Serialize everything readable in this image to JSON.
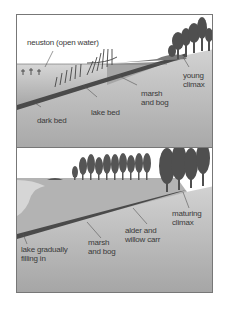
{
  "diagram": {
    "panels": [
      {
        "id": "stage-1",
        "labels": {
          "neuston": "neuston (open water)",
          "dark_bed": "dark bed",
          "lake_bed": "lake bed",
          "marsh_line1": "marsh",
          "marsh_line2": "and bog",
          "climax_line1": "young",
          "climax_line2": "climax"
        }
      },
      {
        "id": "stage-2",
        "labels": {
          "lake_line1": "lake gradually",
          "lake_line2": "filling in",
          "marsh_line1": "marsh",
          "marsh_line2": "and bog",
          "carr_line1": "alder and",
          "carr_line2": "willow carr",
          "climax_line1": "maturing",
          "climax_line2": "climax"
        }
      }
    ],
    "colors": {
      "ground": "#c4c4c4",
      "ground_dark": "#9a9a9a",
      "water": "#b8b8b8",
      "dark_bed": "#4a4a4a",
      "tree": "#4f4f4f",
      "border": "#777777"
    }
  }
}
